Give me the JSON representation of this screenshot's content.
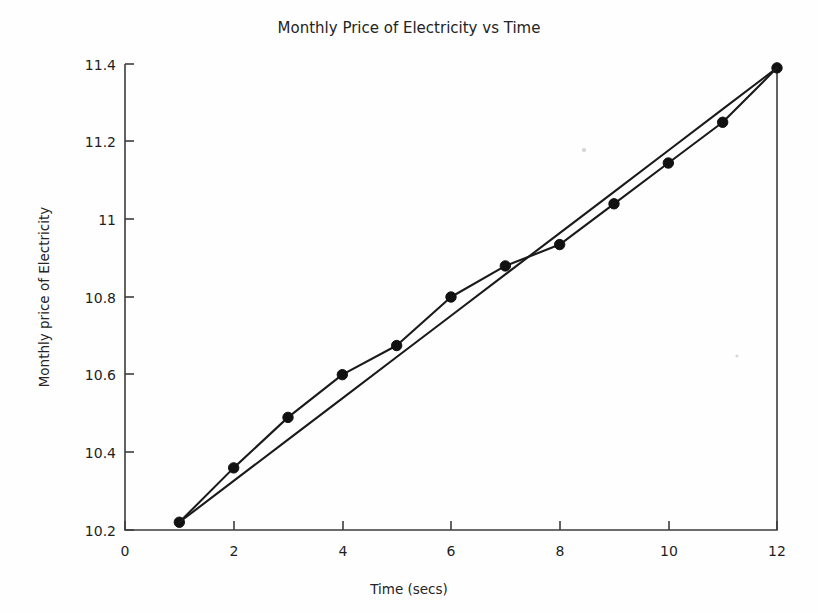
{
  "chart_data": {
    "type": "line",
    "title": "Monthly Price of Electricity vs Time",
    "xlabel": "Time (secs)",
    "ylabel": "Monthly price of Electricity",
    "xlim": [
      0,
      12
    ],
    "ylim": [
      10.2,
      11.4
    ],
    "grid": false,
    "legend": "none",
    "x": [
      1,
      2,
      3,
      4,
      5,
      6,
      7,
      8,
      9,
      10,
      11,
      12
    ],
    "xticks": [
      0,
      2,
      4,
      6,
      8,
      10,
      12
    ],
    "xticklabels": [
      "0",
      "2",
      "4",
      "6",
      "8",
      "10",
      "12"
    ],
    "yticks": [
      10.2,
      10.4,
      10.6,
      10.8,
      11,
      11.2,
      11.4
    ],
    "yticklabels": [
      "10.2",
      "10.4",
      "10.6",
      "10.8",
      "11",
      "11.2",
      "11.4"
    ],
    "series": [
      {
        "name": "Monthly price of Electricity",
        "marker": "circle",
        "values": [
          10.22,
          10.36,
          10.49,
          10.6,
          10.675,
          10.8,
          10.88,
          10.935,
          11.04,
          11.145,
          11.25,
          11.39
        ]
      },
      {
        "name": "Linear trend",
        "marker": "none",
        "values": [
          10.22,
          10.3264,
          10.4327,
          10.5391,
          10.6455,
          10.7518,
          10.8582,
          10.9645,
          11.0709,
          11.1773,
          11.2836,
          11.39
        ]
      }
    ]
  }
}
